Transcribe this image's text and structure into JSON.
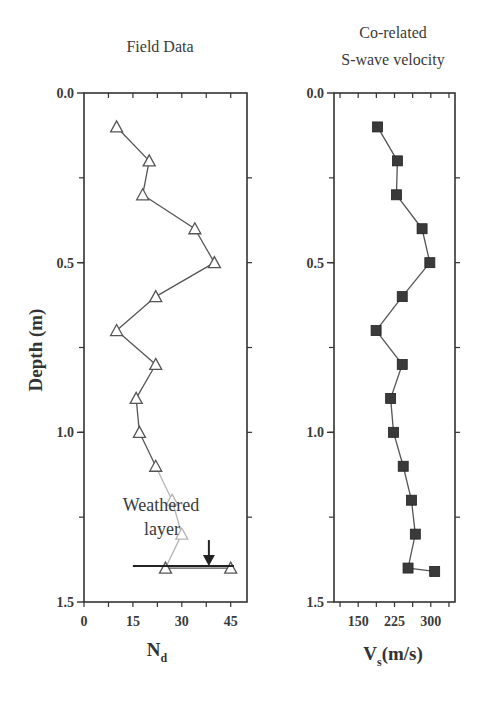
{
  "chart_data": [
    {
      "type": "line",
      "title": "Field Data",
      "xlabel": "N",
      "xlabel_subscript": "d",
      "ylabel": "Depth (m)",
      "xlim": [
        0,
        50
      ],
      "ylim": [
        0.0,
        1.5
      ],
      "y_inverted": true,
      "x_ticks": [
        "0",
        "15",
        "30",
        "45"
      ],
      "x_tick_values": [
        0,
        15,
        30,
        45
      ],
      "y_ticks": [
        "0.0",
        "0.5",
        "1.0",
        "1.5"
      ],
      "y_tick_values": [
        0.0,
        0.5,
        1.0,
        1.5
      ],
      "marker": "open-triangle",
      "grid": false,
      "series": [
        {
          "name": "N_d",
          "depth": [
            0.1,
            0.2,
            0.3,
            0.4,
            0.5,
            0.6,
            0.7,
            0.8,
            0.9,
            1.0,
            1.1,
            1.2,
            1.3,
            1.4,
            1.4
          ],
          "values": [
            10,
            20,
            18,
            34,
            40,
            22,
            10,
            22,
            16,
            17,
            22,
            27,
            30,
            25,
            45
          ]
        }
      ],
      "annotations": [
        {
          "text_line1": "Weathered",
          "text_line2": "layer",
          "type": "horizontal-line-with-arrow",
          "depth": 1.4,
          "x_range": [
            15,
            46
          ],
          "arrow_x": 38
        }
      ]
    },
    {
      "type": "line",
      "title": "Co-related S-wave velocity",
      "title_line1": "Co-related",
      "title_line2": "S-wave velocity",
      "xlabel": "V",
      "xlabel_subscript": "s",
      "xlabel_suffix": "(m/s)",
      "ylabel": "",
      "xlim": [
        100,
        350
      ],
      "ylim": [
        0.0,
        1.5
      ],
      "y_inverted": true,
      "x_ticks": [
        "150",
        "225",
        "300"
      ],
      "x_tick_values": [
        150,
        225,
        300
      ],
      "y_ticks": [
        "0.0",
        "0.5",
        "1.0",
        "1.5"
      ],
      "y_tick_values": [
        0.0,
        0.5,
        1.0,
        1.5
      ],
      "marker": "filled-square",
      "grid": false,
      "series": [
        {
          "name": "Vs",
          "depth": [
            0.1,
            0.2,
            0.3,
            0.4,
            0.5,
            0.6,
            0.7,
            0.8,
            0.9,
            1.0,
            1.1,
            1.2,
            1.3,
            1.4,
            1.41
          ],
          "values": [
            190,
            231,
            229,
            282,
            298,
            241,
            187,
            241,
            217,
            223,
            243,
            260,
            268,
            253,
            308
          ]
        }
      ]
    }
  ],
  "colors": {
    "axis": "#333333",
    "line": "#555555",
    "faint_line": "#b5b5b5",
    "marker_fill_square": "#3a3a3a",
    "text": "#3a3a3a"
  }
}
